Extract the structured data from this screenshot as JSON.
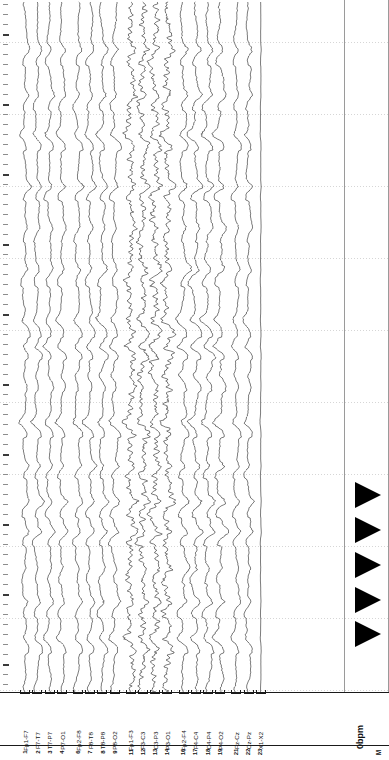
{
  "header": {
    "settings_text": "[SENS 7  HF 70  TC 0.3  CAL 50]",
    "sensitivity": "SENS 7",
    "high_filter": "HF 70",
    "time_constant": "TC 0.3",
    "calibration": "CAL 50"
  },
  "readout": {
    "heart_rate": "0bpm",
    "montage_mark": "M"
  },
  "channels": [
    {
      "num": "1",
      "label": "Fp1-F7",
      "group": 0
    },
    {
      "num": "2",
      "label": "F7-T7",
      "group": 0
    },
    {
      "num": "3",
      "label": "T7-P7",
      "group": 0
    },
    {
      "num": "4",
      "label": "P7-O1",
      "group": 0
    },
    {
      "num": "6",
      "label": "Fp2-F8",
      "group": 1
    },
    {
      "num": "7",
      "label": "F8-T8",
      "group": 1
    },
    {
      "num": "8",
      "label": "T8-P8",
      "group": 1
    },
    {
      "num": "9",
      "label": "P8-O2",
      "group": 1
    },
    {
      "num": "11",
      "label": "Fp1-F3",
      "group": 2
    },
    {
      "num": "12",
      "label": "F3-C3",
      "group": 2
    },
    {
      "num": "13",
      "label": "C3-P3",
      "group": 2
    },
    {
      "num": "14",
      "label": "P3-O1",
      "group": 2
    },
    {
      "num": "16",
      "label": "Fp2-F4",
      "group": 3
    },
    {
      "num": "17",
      "label": "F4-C4",
      "group": 3
    },
    {
      "num": "18",
      "label": "C4-P4",
      "group": 3
    },
    {
      "num": "19",
      "label": "P4-O2",
      "group": 3
    },
    {
      "num": "21",
      "label": "Fz-Cz",
      "group": 4
    },
    {
      "num": "22",
      "label": "Cz-Pz",
      "group": 4
    },
    {
      "num": "23",
      "label": "X1-X2",
      "group": 4
    }
  ],
  "markers": {
    "count": 5,
    "color": "#000000",
    "shape": "right-triangle",
    "y_positions": [
      495,
      530,
      565,
      600,
      634
    ]
  },
  "colors": {
    "trace": "#2b2b2b",
    "grid": "#cfcfcf",
    "rule": "#9a9a9a",
    "text": "#111111",
    "background": "#ffffff"
  },
  "grid": {
    "horizontal_line_spacing_px": 72,
    "tick_spacing_px": 10,
    "orientation": "rotated-90",
    "page_width": 389,
    "page_height": 760
  },
  "chart_data": {
    "type": "line",
    "title": "[SENS 7  HF 70  TC 0.3  CAL 50]",
    "xlabel": "",
    "ylabel": "",
    "orientation": "vertical-traces-time-downward",
    "legend": "none",
    "grid": true,
    "series": [
      {
        "name": "Fp1-F7"
      },
      {
        "name": "F7-T7"
      },
      {
        "name": "T7-P7"
      },
      {
        "name": "P7-O1"
      },
      {
        "name": "Fp2-F8"
      },
      {
        "name": "F8-T8"
      },
      {
        "name": "T8-P8"
      },
      {
        "name": "P8-O2"
      },
      {
        "name": "Fp1-F3"
      },
      {
        "name": "F3-C3"
      },
      {
        "name": "C3-P3"
      },
      {
        "name": "P3-O1"
      },
      {
        "name": "Fp2-F4"
      },
      {
        "name": "F4-C4"
      },
      {
        "name": "C4-P4"
      },
      {
        "name": "P4-O2"
      },
      {
        "name": "Fz-Cz"
      },
      {
        "name": "Cz-Pz"
      },
      {
        "name": "X1-X2"
      }
    ]
  }
}
